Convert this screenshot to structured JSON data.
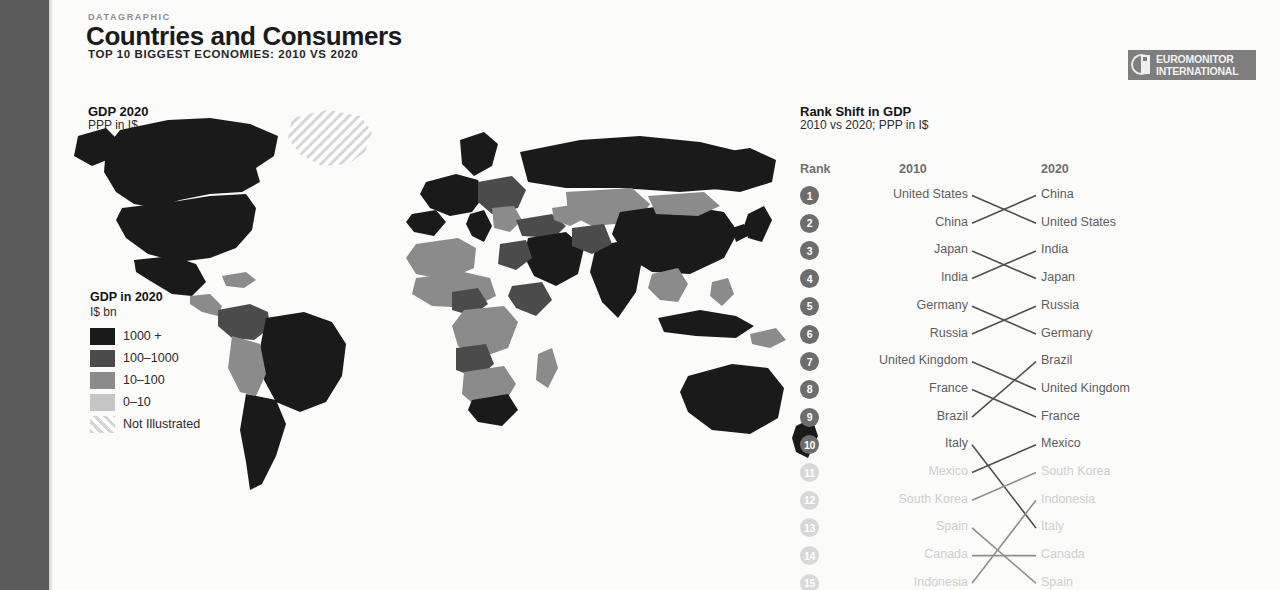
{
  "header": {
    "kicker": "DATAGRAPHIC",
    "title": "Countries and Consumers",
    "subtitle": "TOP 10 BIGGEST ECONOMIES: 2010 VS 2020"
  },
  "logo": {
    "line1": "EUROMONITOR",
    "line2": "INTERNATIONAL"
  },
  "map": {
    "title": "GDP 2020",
    "subtitle": "PPP in I$",
    "legend": {
      "title": "GDP in 2020",
      "unit": "I$ bn",
      "items": [
        {
          "label": "1000 +",
          "color": "#1a1a1a",
          "pattern": "solid"
        },
        {
          "label": "100–1000",
          "color": "#4b4b4b",
          "pattern": "solid"
        },
        {
          "label": "10–100",
          "color": "#8b8b8b",
          "pattern": "solid"
        },
        {
          "label": "0–10",
          "color": "#c6c6c6",
          "pattern": "solid"
        },
        {
          "label": "Not Illustrated",
          "color": "#d9d9d9",
          "pattern": "hatch"
        }
      ]
    }
  },
  "rank_panel": {
    "title": "Rank Shift in GDP",
    "subtitle": "2010 vs 2020; PPP in I$",
    "columns": {
      "rank": "Rank",
      "left": "2010",
      "right": "2020"
    },
    "rows": [
      {
        "rank": "1",
        "y2010": "United States",
        "y2020": "China",
        "faded": false
      },
      {
        "rank": "2",
        "y2010": "China",
        "y2020": "United States",
        "faded": false
      },
      {
        "rank": "3",
        "y2010": "Japan",
        "y2020": "India",
        "faded": false
      },
      {
        "rank": "4",
        "y2010": "India",
        "y2020": "Japan",
        "faded": false
      },
      {
        "rank": "5",
        "y2010": "Germany",
        "y2020": "Russia",
        "faded": false
      },
      {
        "rank": "6",
        "y2010": "Russia",
        "y2020": "Germany",
        "faded": false
      },
      {
        "rank": "7",
        "y2010": "United Kingdom",
        "y2020": "Brazil",
        "faded": false
      },
      {
        "rank": "8",
        "y2010": "France",
        "y2020": "United Kingdom",
        "faded": false
      },
      {
        "rank": "9",
        "y2010": "Brazil",
        "y2020": "France",
        "faded": false
      },
      {
        "rank": "10",
        "y2010": "Italy",
        "y2020": "Mexico",
        "faded": false
      },
      {
        "rank": "11",
        "y2010": "Mexico",
        "y2020": "South Korea",
        "faded": true
      },
      {
        "rank": "12",
        "y2010": "South Korea",
        "y2020": "Indonesia",
        "faded": true
      },
      {
        "rank": "13",
        "y2010": "Spain",
        "y2020": "Italy",
        "faded": true
      },
      {
        "rank": "14",
        "y2010": "Canada",
        "y2020": "Canada",
        "faded": true
      },
      {
        "rank": "15",
        "y2010": "Indonesia",
        "y2020": "Spain",
        "faded": true
      }
    ],
    "connections": [
      {
        "from": 1,
        "to": 2
      },
      {
        "from": 2,
        "to": 1
      },
      {
        "from": 3,
        "to": 4
      },
      {
        "from": 4,
        "to": 3
      },
      {
        "from": 5,
        "to": 6
      },
      {
        "from": 6,
        "to": 5
      },
      {
        "from": 7,
        "to": 8
      },
      {
        "from": 8,
        "to": 9
      },
      {
        "from": 9,
        "to": 7
      },
      {
        "from": 10,
        "to": 13
      },
      {
        "from": 11,
        "to": 10
      },
      {
        "from": 12,
        "to": 11
      },
      {
        "from": 13,
        "to": 15
      },
      {
        "from": 14,
        "to": 14
      },
      {
        "from": 15,
        "to": 12
      }
    ]
  },
  "chart_data": {
    "type": "table",
    "title": "Rank Shift in GDP",
    "subtitle": "2010 vs 2020; PPP in I$",
    "columns": [
      "Rank",
      "2010",
      "2020"
    ],
    "rows": [
      [
        "1",
        "United States",
        "China"
      ],
      [
        "2",
        "China",
        "United States"
      ],
      [
        "3",
        "Japan",
        "India"
      ],
      [
        "4",
        "India",
        "Japan"
      ],
      [
        "5",
        "Germany",
        "Russia"
      ],
      [
        "6",
        "Russia",
        "Germany"
      ],
      [
        "7",
        "United Kingdom",
        "Brazil"
      ],
      [
        "8",
        "France",
        "United Kingdom"
      ],
      [
        "9",
        "Brazil",
        "France"
      ],
      [
        "10",
        "Italy",
        "Mexico"
      ],
      [
        "11",
        "Mexico",
        "South Korea"
      ],
      [
        "12",
        "South Korea",
        "Indonesia"
      ],
      [
        "13",
        "Spain",
        "Italy"
      ],
      [
        "14",
        "Canada",
        "Canada"
      ],
      [
        "15",
        "Indonesia",
        "Spain"
      ]
    ],
    "map_legend_bins": [
      "1000 +",
      "100–1000",
      "10–100",
      "0–10",
      "Not Illustrated"
    ],
    "map_measure": "GDP in 2020, I$ bn, PPP"
  }
}
